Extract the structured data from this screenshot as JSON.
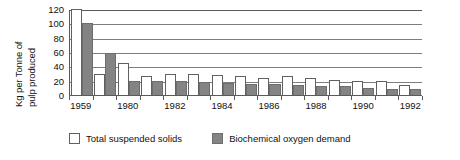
{
  "chart_data": {
    "type": "bar",
    "title": "",
    "xlabel": "",
    "ylabel_lines": [
      "Kg per Tonne of",
      "pulp produced"
    ],
    "ylabel": "Kg per Tonne of pulp produced",
    "ylim": [
      0,
      120
    ],
    "yticks": [
      120,
      100,
      80,
      60,
      40,
      20,
      0
    ],
    "grid": true,
    "legend_position": "bottom",
    "categories": [
      "1959",
      "1979",
      "1980",
      "1981",
      "1982",
      "1983",
      "1984",
      "1985",
      "1986",
      "1987",
      "1988",
      "1989",
      "1990",
      "1991",
      "1992"
    ],
    "tick_labels": [
      "1959",
      "",
      "1980",
      "",
      "1982",
      "",
      "1984",
      "",
      "1986",
      "",
      "1988",
      "",
      "1990",
      "",
      "1992"
    ],
    "series": [
      {
        "name": "Total suspended solids",
        "color": "#ffffff",
        "values": [
          120,
          29,
          44,
          26,
          30,
          29,
          28,
          26,
          24,
          27,
          24,
          21,
          20,
          20,
          14
        ]
      },
      {
        "name": "Biochemical oxygen demand",
        "color": "#848484",
        "values": [
          101,
          58,
          20,
          20,
          19,
          18,
          17,
          16,
          16,
          14,
          13,
          12,
          10,
          9,
          8
        ]
      }
    ]
  },
  "legend": {
    "items": [
      {
        "label": "Total suspended solids",
        "swatch": "open-square-icon"
      },
      {
        "label": "Biochemical oxygen demand",
        "swatch": "filled-square-icon"
      }
    ]
  }
}
